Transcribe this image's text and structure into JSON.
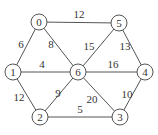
{
  "graph": {
    "type": "undirected-weighted",
    "nodes": [
      {
        "id": "0",
        "label": "0",
        "x": 39,
        "y": 22
      },
      {
        "id": "5",
        "label": "5",
        "x": 119,
        "y": 23
      },
      {
        "id": "1",
        "label": "1",
        "x": 13,
        "y": 72
      },
      {
        "id": "6",
        "label": "6",
        "x": 78,
        "y": 72
      },
      {
        "id": "4",
        "label": "4",
        "x": 145,
        "y": 72
      },
      {
        "id": "2",
        "label": "2",
        "x": 40,
        "y": 117
      },
      {
        "id": "3",
        "label": "3",
        "x": 120,
        "y": 117
      }
    ],
    "edges": [
      {
        "from": "0",
        "to": "5",
        "weight": "12",
        "lx": 79,
        "ly": 18
      },
      {
        "from": "0",
        "to": "1",
        "weight": "6",
        "lx": 21,
        "ly": 48
      },
      {
        "from": "0",
        "to": "6",
        "weight": "8",
        "lx": 51,
        "ly": 48
      },
      {
        "from": "5",
        "to": "6",
        "weight": "15",
        "lx": 89,
        "ly": 50
      },
      {
        "from": "5",
        "to": "4",
        "weight": "13",
        "lx": 125,
        "ly": 50
      },
      {
        "from": "1",
        "to": "6",
        "weight": "4",
        "lx": 42,
        "ly": 68
      },
      {
        "from": "6",
        "to": "4",
        "weight": "16",
        "lx": 113,
        "ly": 68
      },
      {
        "from": "1",
        "to": "2",
        "weight": "12",
        "lx": 19,
        "ly": 101
      },
      {
        "from": "6",
        "to": "2",
        "weight": "9",
        "lx": 58,
        "ly": 97
      },
      {
        "from": "6",
        "to": "3",
        "weight": "20",
        "lx": 92,
        "ly": 103
      },
      {
        "from": "4",
        "to": "3",
        "weight": "10",
        "lx": 127,
        "ly": 98
      },
      {
        "from": "2",
        "to": "3",
        "weight": "5",
        "lx": 80,
        "ly": 113
      }
    ],
    "node_radius": 8,
    "colors": {
      "stroke": "#555555",
      "text": "#333333",
      "background": "#ffffff"
    }
  }
}
